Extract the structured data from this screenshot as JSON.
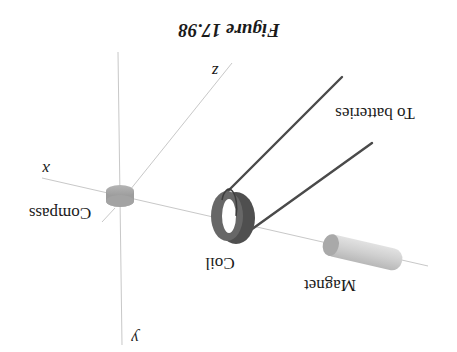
{
  "figure": {
    "caption": "Figure 17.98",
    "orientation": "rotated 180 degrees",
    "axes": {
      "x_label": "x",
      "y_label": "y",
      "z_label": "z"
    },
    "components": {
      "compass_label": "Compass",
      "coil_label": "Coil",
      "magnet_label": "Magnet",
      "wires_label": "To batteries"
    },
    "colors": {
      "axis": "#c8c8c8",
      "wire": "#4a4a4a",
      "coil": "#5a5a5a",
      "compass": "#a8a8a8",
      "magnet": "#d0d0d0"
    }
  }
}
